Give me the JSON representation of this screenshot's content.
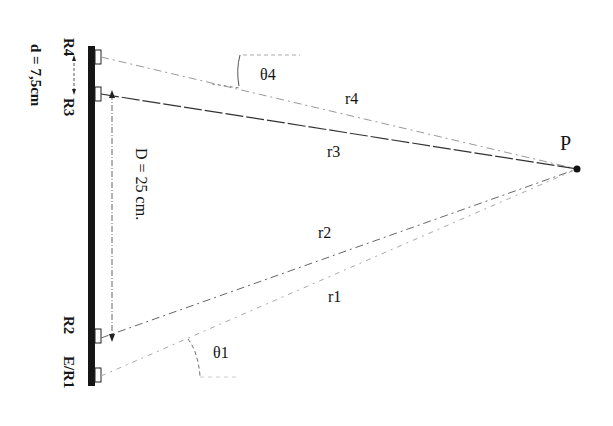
{
  "diagram": {
    "type": "geometry",
    "colors": {
      "ink": "#151515",
      "dashed": "#555555",
      "light_dash": "#999999",
      "background": "#ffffff"
    },
    "point": {
      "label": "P",
      "x": 577,
      "y": 169
    },
    "bar": {
      "x": 88,
      "y": 46,
      "width": 7,
      "height": 340
    },
    "transducers": [
      {
        "id": "R4",
        "label": "R4",
        "y": 57
      },
      {
        "id": "R3",
        "label": "R3",
        "y": 94
      },
      {
        "id": "R2",
        "label": "R2",
        "y": 336
      },
      {
        "id": "ER1",
        "label": "E/R1",
        "y": 375
      }
    ],
    "rays": [
      {
        "label": "r4",
        "from": "R4",
        "style": "dash-dot-light"
      },
      {
        "label": "r3",
        "from": "R3",
        "style": "solid-dashed"
      },
      {
        "label": "r2",
        "from": "R2",
        "style": "dash-dot"
      },
      {
        "label": "r1",
        "from": "ER1",
        "style": "dash-dot-light"
      }
    ],
    "angles": [
      {
        "label": "θ4"
      },
      {
        "label": "θ1"
      }
    ],
    "dimensions": {
      "D": "D = 25 cm.",
      "d": "d = 7,5cm"
    }
  }
}
